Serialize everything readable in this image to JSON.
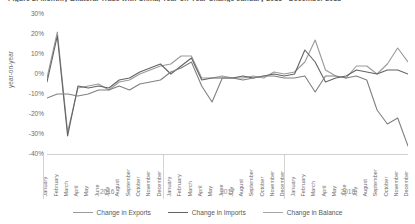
{
  "figure": {
    "title": "Figure 2: Monthly Bilateral Trade with China, Year-on-Year Change January 2016 - December 2018"
  },
  "chart_data": {
    "type": "line",
    "title": "Figure 2: Monthly Bilateral Trade with China, Year-on-Year Change January 2016 - December 2018",
    "xlabel": "",
    "ylabel": "year-on-year",
    "ylim": [
      -40,
      30
    ],
    "ytick_labels": [
      "30%",
      "20%",
      "10%",
      "0%",
      "-10%",
      "-20%",
      "-30%",
      "-40%"
    ],
    "ytick_values": [
      30,
      20,
      10,
      0,
      -10,
      -20,
      -30,
      -40
    ],
    "grid": false,
    "legend_position": "bottom",
    "year_groups": [
      "2016",
      "2017",
      "2018"
    ],
    "months": [
      "January",
      "February",
      "March",
      "April",
      "May",
      "June",
      "July",
      "August",
      "September",
      "October",
      "November",
      "December"
    ],
    "categories": [
      "January 2016",
      "February 2016",
      "March 2016",
      "April 2016",
      "May 2016",
      "June 2016",
      "July 2016",
      "August 2016",
      "September 2016",
      "October 2016",
      "November 2016",
      "December 2016",
      "January 2017",
      "February 2017",
      "March 2017",
      "April 2017",
      "May 2017",
      "June 2017",
      "July 2017",
      "August 2017",
      "September 2017",
      "October 2017",
      "November 2017",
      "December 2017",
      "January 2018",
      "February 2018",
      "March 2018",
      "April 2018",
      "May 2018",
      "June 2018",
      "July 2018",
      "August 2018",
      "September 2018",
      "October 2018",
      "November 2018",
      "December 2018"
    ],
    "series": [
      {
        "name": "Change in Exports",
        "color": "#9a9a9a",
        "values": [
          -2,
          21,
          -29,
          -7,
          -6,
          -5,
          -8,
          -4,
          -3,
          0,
          2,
          4,
          5,
          9,
          9,
          -2,
          -2,
          -1,
          -2,
          -2,
          -1,
          -2,
          1,
          0,
          1,
          6,
          17,
          2,
          -1,
          -2,
          4,
          4,
          0,
          5,
          13,
          6
        ]
      },
      {
        "name": "Change in Imports",
        "color": "#636363",
        "values": [
          -4,
          19,
          -31,
          -6,
          -7,
          -6,
          -7,
          -3,
          -2,
          1,
          3,
          5,
          0,
          4,
          8,
          -3,
          -2,
          -2,
          -2,
          -1,
          -2,
          -1,
          0,
          -1,
          0,
          12,
          6,
          -4,
          -2,
          -1,
          2,
          1,
          0,
          2,
          2,
          0
        ]
      },
      {
        "name": "Change in Balance",
        "color": "#808080",
        "values": [
          -12,
          -10,
          -10,
          -11,
          -10,
          -8,
          -8,
          -6,
          -8,
          -5,
          -4,
          -3,
          1,
          3,
          6,
          -6,
          -14,
          -2,
          -2,
          -3,
          -2,
          -1,
          -1,
          -2,
          -2,
          -1,
          -9,
          -1,
          -1,
          -2,
          -1,
          -3,
          -18,
          -25,
          -22,
          -36
        ]
      }
    ]
  },
  "legend": {
    "items": [
      {
        "label": "Change in Exports",
        "color": "#9a9a9a"
      },
      {
        "label": "Change in Imports",
        "color": "#636363"
      },
      {
        "label": "Change in Balance",
        "color": "#a6a6a6"
      }
    ]
  }
}
